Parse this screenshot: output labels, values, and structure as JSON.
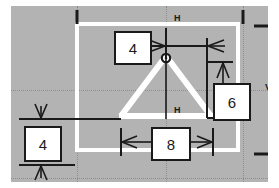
{
  "sketch": {
    "title": "CAD sketch with dimensions",
    "canvas_bg": "#b3b3b3",
    "geometry_color": "#ffffff",
    "annotation_color": "#1a1a1a",
    "dimensions": [
      {
        "id": "top",
        "label": "4",
        "orientation": "horizontal",
        "name": "dimension-value-4-top"
      },
      {
        "id": "left",
        "label": "4",
        "orientation": "vertical",
        "name": "dimension-value-4-left"
      },
      {
        "id": "right",
        "label": "6",
        "orientation": "vertical",
        "name": "dimension-value-6-right"
      },
      {
        "id": "bottom",
        "label": "8",
        "orientation": "horizontal",
        "name": "dimension-value-8-bottom"
      }
    ],
    "constraints": [
      {
        "id": "h-top",
        "glyph": "H",
        "meaning": "horizontal-constraint"
      },
      {
        "id": "h-mid",
        "glyph": "H",
        "meaning": "horizontal-constraint"
      },
      {
        "id": "v-right",
        "glyph": "V",
        "meaning": "vertical-constraint"
      }
    ],
    "shapes": {
      "rectangle": "construction-rectangle",
      "triangle": "triangle-profile",
      "origin": "origin-point-marker"
    }
  }
}
